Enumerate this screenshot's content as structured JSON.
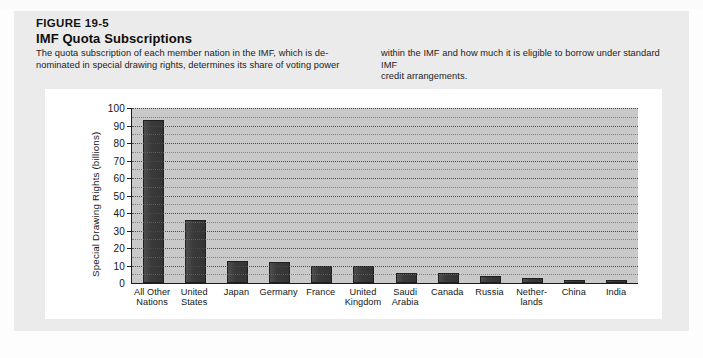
{
  "page": {
    "running_head": ""
  },
  "figure": {
    "number": "FIGURE 19-5",
    "title": "IMF Quota Subscriptions",
    "caption_left_p1": "The quota subscription of each member nation in the IMF, which is de-",
    "caption_left_p2": "nominated in special drawing rights, determines its share of voting power",
    "caption_right_p1": "within the IMF and how much it is eligible to borrow under standard IMF",
    "caption_right_p2": "credit arrangements.",
    "source": "Source: International Monetary Fund."
  },
  "chart_data": {
    "type": "bar",
    "title": "IMF Quota Subscriptions",
    "xlabel": "",
    "ylabel": "Special Drawing Rights (billions)",
    "ylim": [
      0,
      100
    ],
    "ytick_step": 10,
    "gridline_step": 5,
    "grid": true,
    "legend": "none",
    "bar_color": "#3a3a3a",
    "plot_background": "#c9c9c9",
    "categories": [
      "All Other Nations",
      "United States",
      "Japan",
      "Germany",
      "France",
      "United Kingdom",
      "Saudi Arabia",
      "Canada",
      "Russia",
      "Netherlands",
      "China",
      "India"
    ],
    "category_lines": [
      [
        "All Other",
        "Nations"
      ],
      [
        "United",
        "States"
      ],
      [
        "Japan",
        ""
      ],
      [
        "Germany",
        ""
      ],
      [
        "France",
        ""
      ],
      [
        "United",
        "Kingdom"
      ],
      [
        "Saudi",
        "Arabia"
      ],
      [
        "Canada",
        ""
      ],
      [
        "Russia",
        ""
      ],
      [
        "Nether-",
        "lands"
      ],
      [
        "China",
        ""
      ],
      [
        "India",
        ""
      ]
    ],
    "values": [
      93,
      36,
      12.5,
      12,
      10,
      9.5,
      6,
      5.5,
      4,
      3,
      2,
      1.5
    ],
    "ytick_labels": [
      "100",
      "90",
      "80",
      "70",
      "60",
      "50",
      "40",
      "30",
      "20",
      "10",
      "0"
    ],
    "ytick_values": [
      100,
      90,
      80,
      70,
      60,
      50,
      40,
      30,
      20,
      10,
      0
    ]
  }
}
